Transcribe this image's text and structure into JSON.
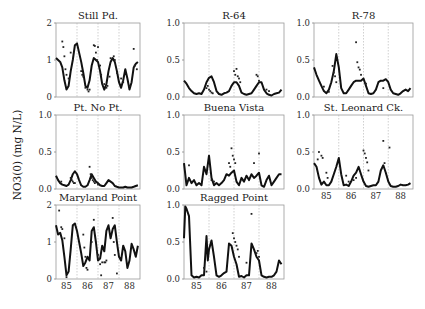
{
  "chart_data": {
    "type": "line",
    "ylabel": "NO3(0) (mg N/L)",
    "x_ticks": [
      "85",
      "86",
      "87",
      "88"
    ],
    "x_range": [
      84.6,
      88.6
    ],
    "year_dividers": [
      85.6,
      86.6,
      87.6
    ],
    "panels": [
      {
        "title": "Still Pd.",
        "ylim": [
          0,
          2
        ],
        "yticks": [
          "0",
          "1",
          "2"
        ],
        "show_xticks": false,
        "model_x": [
          84.6,
          84.7,
          84.8,
          84.9,
          85.0,
          85.1,
          85.2,
          85.3,
          85.4,
          85.5,
          85.6,
          85.7,
          85.8,
          85.9,
          86.0,
          86.1,
          86.2,
          86.3,
          86.4,
          86.5,
          86.6,
          86.7,
          86.8,
          86.9,
          87.0,
          87.1,
          87.2,
          87.3,
          87.4,
          87.5,
          87.6,
          87.7,
          87.8,
          87.9,
          88.0,
          88.1,
          88.2,
          88.3,
          88.4,
          88.5
        ],
        "model_y": [
          1.05,
          1.0,
          0.95,
          0.8,
          0.45,
          0.2,
          0.3,
          0.7,
          1.0,
          1.4,
          1.45,
          1.2,
          0.95,
          0.65,
          0.3,
          0.25,
          0.45,
          0.85,
          1.05,
          1.0,
          0.95,
          0.7,
          0.35,
          0.2,
          0.35,
          0.7,
          0.95,
          1.05,
          0.95,
          0.7,
          0.4,
          0.25,
          0.45,
          0.75,
          0.5,
          0.2,
          0.4,
          0.8,
          0.9,
          0.95
        ],
        "obs_x": [
          84.9,
          84.95,
          85.0,
          85.05,
          85.1,
          85.2,
          85.3,
          85.8,
          85.85,
          85.9,
          86.0,
          86.1,
          86.15,
          86.2,
          86.4,
          86.45,
          86.5,
          86.55,
          86.6,
          86.7,
          86.75,
          86.9,
          87.0,
          87.05,
          87.15,
          87.2,
          87.35,
          87.4,
          87.5,
          87.7,
          87.8,
          88.1,
          88.3,
          88.35,
          88.45
        ],
        "obs_y": [
          1.5,
          1.35,
          1.1,
          0.75,
          0.6,
          0.5,
          1.2,
          0.7,
          0.6,
          0.55,
          0.25,
          0.2,
          0.15,
          0.2,
          1.4,
          1.38,
          1.2,
          1.0,
          1.35,
          0.85,
          0.6,
          0.35,
          0.25,
          0.3,
          0.55,
          1.05,
          1.1,
          1.0,
          0.65,
          0.5,
          0.4,
          0.3,
          1.3,
          0.85,
          0.75
        ]
      },
      {
        "title": "R-64",
        "ylim": [
          0,
          1
        ],
        "yticks": [
          "0.0",
          "0.5",
          "1.0"
        ],
        "show_xticks": false,
        "model_x": [
          84.6,
          84.7,
          84.8,
          84.9,
          85.0,
          85.1,
          85.2,
          85.3,
          85.4,
          85.5,
          85.6,
          85.7,
          85.8,
          85.9,
          86.0,
          86.1,
          86.2,
          86.3,
          86.4,
          86.5,
          86.6,
          86.7,
          86.8,
          86.9,
          87.0,
          87.1,
          87.2,
          87.3,
          87.4,
          87.5,
          87.6,
          87.7,
          87.8,
          87.9,
          88.0,
          88.1,
          88.2,
          88.3,
          88.4,
          88.5
        ],
        "model_y": [
          0.22,
          0.18,
          0.12,
          0.08,
          0.05,
          0.04,
          0.05,
          0.04,
          0.1,
          0.2,
          0.26,
          0.28,
          0.2,
          0.08,
          0.04,
          0.03,
          0.05,
          0.06,
          0.08,
          0.15,
          0.2,
          0.2,
          0.15,
          0.06,
          0.04,
          0.03,
          0.04,
          0.05,
          0.1,
          0.15,
          0.2,
          0.2,
          0.1,
          0.05,
          0.03,
          0.02,
          0.04,
          0.05,
          0.06,
          0.1
        ],
        "obs_x": [
          85.5,
          85.55,
          85.6,
          85.65,
          85.7,
          85.75,
          86.6,
          86.65,
          86.7,
          86.75,
          86.8,
          86.85,
          87.5,
          87.55,
          87.6,
          87.9,
          88.0
        ],
        "obs_y": [
          0.12,
          0.15,
          0.1,
          0.08,
          0.06,
          0.05,
          0.35,
          0.3,
          0.38,
          0.28,
          0.25,
          0.2,
          0.3,
          0.28,
          0.22,
          0.1,
          0.08
        ]
      },
      {
        "title": "R-78",
        "ylim": [
          0,
          1
        ],
        "yticks": [
          "0.0",
          "0.5",
          "1.0"
        ],
        "show_xticks": false,
        "model_x": [
          84.6,
          84.7,
          84.8,
          84.9,
          85.0,
          85.1,
          85.2,
          85.3,
          85.4,
          85.5,
          85.6,
          85.7,
          85.8,
          85.9,
          86.0,
          86.1,
          86.2,
          86.3,
          86.4,
          86.5,
          86.6,
          86.7,
          86.8,
          86.9,
          87.0,
          87.1,
          87.2,
          87.3,
          87.4,
          87.5,
          87.6,
          87.7,
          87.8,
          87.9,
          88.0,
          88.1,
          88.2,
          88.3,
          88.4,
          88.5
        ],
        "model_y": [
          0.4,
          0.3,
          0.22,
          0.15,
          0.08,
          0.05,
          0.1,
          0.2,
          0.35,
          0.58,
          0.4,
          0.12,
          0.05,
          0.05,
          0.1,
          0.15,
          0.2,
          0.22,
          0.22,
          0.22,
          0.25,
          0.15,
          0.05,
          0.04,
          0.05,
          0.1,
          0.2,
          0.22,
          0.22,
          0.24,
          0.2,
          0.1,
          0.05,
          0.04,
          0.03,
          0.05,
          0.08,
          0.1,
          0.08,
          0.12
        ],
        "obs_x": [
          85.0,
          85.2,
          85.35,
          85.4,
          85.45,
          85.5,
          86.3,
          86.35,
          86.4,
          86.45,
          86.5,
          86.7,
          87.4
        ],
        "obs_y": [
          0.14,
          0.07,
          0.42,
          0.33,
          0.28,
          0.2,
          0.74,
          0.47,
          0.4,
          0.37,
          0.3,
          0.18,
          0.12
        ]
      },
      {
        "title": "Pt. No Pt.",
        "ylim": [
          0,
          1
        ],
        "yticks": [
          "0.0",
          "0.5",
          "1.0"
        ],
        "show_xticks": false,
        "model_x": [
          84.6,
          84.7,
          84.8,
          84.9,
          85.0,
          85.1,
          85.2,
          85.3,
          85.4,
          85.5,
          85.6,
          85.7,
          85.8,
          85.9,
          86.0,
          86.1,
          86.2,
          86.3,
          86.4,
          86.5,
          86.6,
          86.7,
          86.8,
          86.9,
          87.0,
          87.1,
          87.2,
          87.3,
          87.4,
          87.5,
          87.6,
          87.7,
          87.8,
          87.9,
          88.0,
          88.1,
          88.2,
          88.3,
          88.4,
          88.5
        ],
        "model_y": [
          0.18,
          0.12,
          0.08,
          0.06,
          0.05,
          0.04,
          0.06,
          0.12,
          0.2,
          0.24,
          0.2,
          0.12,
          0.05,
          0.03,
          0.03,
          0.05,
          0.12,
          0.2,
          0.15,
          0.1,
          0.08,
          0.05,
          0.04,
          0.04,
          0.08,
          0.12,
          0.1,
          0.08,
          0.04,
          0.03,
          0.02,
          0.02,
          0.02,
          0.03,
          0.02,
          0.02,
          0.02,
          0.03,
          0.04,
          0.05
        ],
        "obs_x": [
          84.85,
          85.3,
          85.35,
          85.4,
          85.45,
          85.5,
          86.2,
          86.25,
          86.3,
          86.35,
          86.4,
          86.45,
          86.6
        ],
        "obs_y": [
          0.1,
          0.15,
          0.12,
          0.1,
          0.08,
          0.08,
          0.3,
          0.2,
          0.15,
          0.12,
          0.1,
          0.08,
          0.06
        ]
      },
      {
        "title": "Buena Vista",
        "ylim": [
          0,
          1
        ],
        "yticks": [
          "0.0",
          "0.5",
          "1.0"
        ],
        "show_xticks": false,
        "model_x": [
          84.6,
          84.7,
          84.8,
          84.9,
          85.0,
          85.1,
          85.2,
          85.3,
          85.4,
          85.5,
          85.6,
          85.7,
          85.8,
          85.9,
          86.0,
          86.1,
          86.2,
          86.3,
          86.4,
          86.5,
          86.6,
          86.7,
          86.8,
          86.9,
          87.0,
          87.1,
          87.2,
          87.3,
          87.4,
          87.5,
          87.6,
          87.7,
          87.8,
          87.9,
          88.0,
          88.1,
          88.2,
          88.3,
          88.4,
          88.5
        ],
        "model_y": [
          0.35,
          0.05,
          0.15,
          0.08,
          0.12,
          0.05,
          0.08,
          0.05,
          0.3,
          0.2,
          0.45,
          0.15,
          0.05,
          0.08,
          0.05,
          0.08,
          0.12,
          0.2,
          0.18,
          0.22,
          0.25,
          0.1,
          0.05,
          0.15,
          0.1,
          0.18,
          0.12,
          0.2,
          0.15,
          0.18,
          0.22,
          0.05,
          0.03,
          0.12,
          0.18,
          0.05,
          0.1,
          0.15,
          0.2,
          0.2
        ],
        "obs_x": [
          84.8,
          85.7,
          85.8,
          86.4,
          86.45,
          86.5,
          86.55,
          86.6,
          86.65,
          87.4,
          87.6
        ],
        "obs_y": [
          0.32,
          0.12,
          0.1,
          0.35,
          0.3,
          0.55,
          0.45,
          0.4,
          0.35,
          0.35,
          0.48
        ]
      },
      {
        "title": "St. Leonard Ck.",
        "ylim": [
          0,
          1
        ],
        "yticks": [
          "0.0",
          "0.5",
          "1.0"
        ],
        "show_xticks": true,
        "model_x": [
          84.6,
          84.7,
          84.8,
          84.9,
          85.0,
          85.1,
          85.2,
          85.3,
          85.4,
          85.5,
          85.6,
          85.7,
          85.8,
          85.9,
          86.0,
          86.1,
          86.2,
          86.3,
          86.4,
          86.5,
          86.6,
          86.7,
          86.8,
          86.9,
          87.0,
          87.1,
          87.2,
          87.3,
          87.4,
          87.5,
          87.6,
          87.7,
          87.8,
          87.9,
          88.0,
          88.1,
          88.2,
          88.3,
          88.4,
          88.5
        ],
        "model_y": [
          0.35,
          0.3,
          0.15,
          0.06,
          0.1,
          0.05,
          0.05,
          0.1,
          0.2,
          0.3,
          0.42,
          0.2,
          0.05,
          0.06,
          0.04,
          0.1,
          0.18,
          0.22,
          0.3,
          0.2,
          0.1,
          0.04,
          0.03,
          0.04,
          0.05,
          0.05,
          0.1,
          0.25,
          0.32,
          0.22,
          0.1,
          0.04,
          0.03,
          0.03,
          0.04,
          0.06,
          0.05,
          0.05,
          0.06,
          0.08
        ],
        "obs_x": [
          84.75,
          84.8,
          84.9,
          84.95,
          85.1,
          85.15,
          85.9,
          86.0,
          86.2,
          86.3,
          86.6,
          86.65,
          86.7,
          86.75,
          86.8,
          87.4,
          87.45,
          87.65
        ],
        "obs_y": [
          0.4,
          0.5,
          0.45,
          0.42,
          0.22,
          0.15,
          0.18,
          0.1,
          0.12,
          0.15,
          0.52,
          0.48,
          0.42,
          0.36,
          0.25,
          0.65,
          0.35,
          0.56
        ]
      },
      {
        "title": "Maryland Point",
        "ylim": [
          0,
          2
        ],
        "yticks": [
          "0",
          "1",
          "2"
        ],
        "show_xticks": true,
        "model_x": [
          84.6,
          84.7,
          84.8,
          84.9,
          85.0,
          85.1,
          85.2,
          85.3,
          85.4,
          85.5,
          85.6,
          85.7,
          85.8,
          85.9,
          86.0,
          86.1,
          86.2,
          86.3,
          86.4,
          86.5,
          86.6,
          86.7,
          86.8,
          86.9,
          87.0,
          87.1,
          87.2,
          87.3,
          87.4,
          87.5,
          87.6,
          87.7,
          87.8,
          87.9,
          88.0,
          88.1,
          88.2,
          88.3,
          88.4,
          88.5
        ],
        "model_y": [
          1.45,
          1.2,
          1.25,
          1.05,
          0.6,
          0.1,
          0.2,
          0.8,
          1.45,
          1.5,
          1.3,
          1.0,
          0.7,
          0.35,
          0.45,
          0.6,
          0.5,
          1.3,
          1.4,
          1.0,
          0.5,
          0.55,
          0.9,
          0.75,
          1.3,
          1.45,
          1.1,
          1.35,
          1.45,
          1.0,
          0.6,
          0.5,
          0.9,
          0.75,
          0.3,
          0.5,
          0.95,
          0.8,
          0.6,
          0.9
        ],
        "obs_x": [
          84.75,
          84.85,
          84.9,
          85.0,
          85.1,
          85.9,
          85.95,
          86.0,
          86.05,
          86.1,
          86.3,
          86.4,
          86.55,
          86.6,
          86.65,
          86.7,
          86.75,
          86.8,
          86.9,
          86.95,
          87.0,
          87.3,
          87.35,
          87.4,
          87.5
        ],
        "obs_y": [
          1.85,
          1.4,
          1.35,
          1.1,
          0.05,
          1.2,
          0.85,
          0.6,
          0.3,
          0.25,
          1.0,
          1.6,
          0.75,
          0.65,
          0.55,
          0.4,
          0.1,
          0.45,
          0.45,
          0.45,
          0.5,
          1.65,
          1.0,
          0.65,
          0.15
        ]
      },
      {
        "title": "Ragged Point",
        "ylim": [
          0,
          1
        ],
        "yticks": [
          "0.0",
          "0.5",
          "1.0"
        ],
        "show_xticks": true,
        "model_x": [
          84.6,
          84.65,
          84.7,
          84.8,
          84.9,
          85.0,
          85.1,
          85.2,
          85.3,
          85.4,
          85.5,
          85.55,
          85.6,
          85.7,
          85.8,
          85.9,
          86.0,
          86.1,
          86.2,
          86.3,
          86.4,
          86.5,
          86.6,
          86.7,
          86.8,
          86.9,
          87.0,
          87.1,
          87.2,
          87.3,
          87.4,
          87.5,
          87.6,
          87.7,
          87.8,
          87.9,
          88.0,
          88.1,
          88.2,
          88.3,
          88.4,
          88.5
        ],
        "model_y": [
          0.55,
          0.98,
          0.95,
          0.85,
          0.05,
          0.02,
          0.03,
          0.02,
          0.05,
          0.05,
          0.58,
          0.25,
          0.4,
          0.52,
          0.3,
          0.05,
          0.03,
          0.05,
          0.08,
          0.1,
          0.48,
          0.45,
          0.3,
          0.2,
          0.03,
          0.04,
          0.02,
          0.05,
          0.05,
          0.48,
          0.4,
          0.3,
          0.25,
          0.05,
          0.03,
          0.02,
          0.03,
          0.03,
          0.05,
          0.1,
          0.25,
          0.2
        ],
        "obs_x": [
          85.4,
          85.5,
          86.55,
          86.6,
          86.65,
          86.7,
          86.75,
          86.8,
          87.1,
          87.3,
          87.5,
          87.55,
          87.6
        ],
        "obs_y": [
          0.15,
          0.1,
          0.62,
          0.55,
          0.5,
          0.45,
          0.4,
          0.3,
          0.22,
          0.88,
          0.35,
          0.38,
          0.3
        ]
      }
    ]
  },
  "layout_panels": [
    {
      "x": 56,
      "y": 23,
      "w": 84,
      "h": 74
    },
    {
      "x": 184,
      "y": 23,
      "w": 100,
      "h": 74
    },
    {
      "x": 314,
      "y": 23,
      "w": 99,
      "h": 74
    },
    {
      "x": 56,
      "y": 115,
      "w": 84,
      "h": 74
    },
    {
      "x": 184,
      "y": 115,
      "w": 100,
      "h": 74
    },
    {
      "x": 314,
      "y": 115,
      "w": 99,
      "h": 74
    },
    {
      "x": 56,
      "y": 205,
      "w": 84,
      "h": 74
    },
    {
      "x": 184,
      "y": 205,
      "w": 100,
      "h": 74
    }
  ]
}
